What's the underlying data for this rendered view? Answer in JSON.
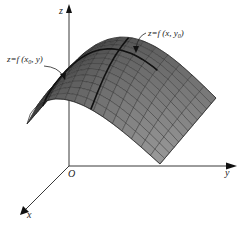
{
  "figure": {
    "axes": {
      "x_label": "x",
      "y_label": "y",
      "z_label": "z",
      "origin_label": "O"
    },
    "annotations": [
      {
        "id": "trace_x0",
        "text_prefix": "z=f (x",
        "subscript": "0",
        "text_suffix": ", y)"
      },
      {
        "id": "trace_y0",
        "text_prefix": "z=f (x, y",
        "subscript": "0",
        "text_suffix": ")"
      }
    ],
    "colors": {
      "surface_dark": "#3a3a3a",
      "surface_mid": "#6e6e6e",
      "surface_light": "#9a9a9a",
      "grid": "#2a2a2a",
      "axis": "#222222",
      "trace": "#111111"
    },
    "grid": {
      "u_lines": 14,
      "v_lines": 12
    }
  }
}
